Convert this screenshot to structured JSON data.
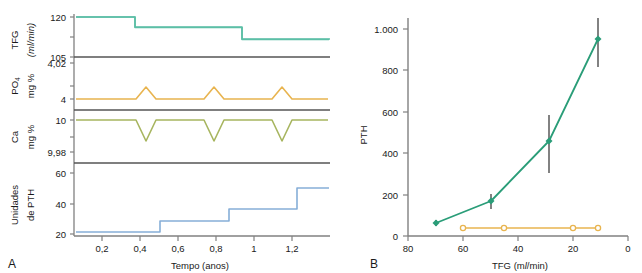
{
  "figure": {
    "panel_a_letter": "A",
    "panel_b_letter": "B"
  },
  "panel_a": {
    "x_axis": {
      "title": "Tempo (anos)",
      "ticks": [
        "0,2",
        "0,4",
        "0,6",
        "0,8",
        "1",
        "1,2"
      ],
      "tick_values": [
        0.2,
        0.4,
        0.6,
        0.8,
        1.0,
        1.2
      ],
      "range": [
        0.1,
        1.37
      ]
    },
    "tracks": [
      {
        "name": "tfg",
        "label_line1": "TFG",
        "label_line2": "(ml/min)",
        "y_ticks": [
          "120",
          "105"
        ],
        "y_tick_values": [
          120,
          105
        ],
        "color": "#5cbfa6"
      },
      {
        "name": "po4",
        "label_line1": "PO4",
        "label_line2": "mg %",
        "y_ticks": [
          "4,02",
          "4"
        ],
        "y_tick_values": [
          4.02,
          4
        ],
        "color": "#e8b44f"
      },
      {
        "name": "ca",
        "label_line1": "Ca",
        "label_line2": "mg %",
        "y_ticks": [
          "10",
          "9,98"
        ],
        "y_tick_values": [
          10,
          9.98
        ],
        "color": "#a7b55f"
      },
      {
        "name": "pth",
        "label_line1": "Unidades",
        "label_line2": "de PTH",
        "y_ticks": [
          "60",
          "40",
          "20"
        ],
        "y_tick_values": [
          60,
          40,
          20
        ],
        "color": "#86aed8"
      }
    ],
    "chart_data": [
      {
        "type": "line",
        "name": "tfg-step-series",
        "title": "TFG (ml/min) ao longo do tempo",
        "xlabel": "Tempo (anos)",
        "ylabel": "TFG (ml/min)",
        "xlim": [
          0.1,
          1.37
        ],
        "ylim": [
          105,
          122
        ],
        "grid": false,
        "step": "post",
        "x": [
          0.1,
          0.295,
          0.295,
          0.615,
          0.615,
          0.955,
          0.955,
          1.37
        ],
        "y": [
          120,
          120,
          117.2,
          117.2,
          113.9,
          113.9,
          110.6,
          110.6
        ]
      },
      {
        "type": "line",
        "name": "po4-series",
        "title": "PO4 mg % ao longo do tempo",
        "xlabel": "Tempo (anos)",
        "ylabel": "PO4 mg %",
        "xlim": [
          0.1,
          1.37
        ],
        "ylim": [
          3.99,
          4.025
        ],
        "grid": false,
        "x": [
          0.1,
          0.3,
          0.35,
          0.4,
          0.62,
          0.665,
          0.71,
          0.935,
          0.985,
          1.03,
          1.26,
          1.305,
          1.37
        ],
        "y": [
          3.997,
          3.997,
          4.012,
          3.997,
          3.997,
          4.012,
          3.997,
          3.997,
          4.012,
          3.997,
          3.997,
          4.012,
          4.005
        ]
      },
      {
        "type": "line",
        "name": "ca-series",
        "title": "Ca mg % ao longo do tempo",
        "xlabel": "Tempo (anos)",
        "ylabel": "Ca mg %",
        "xlim": [
          0.1,
          1.37
        ],
        "ylim": [
          9.975,
          10.004
        ],
        "grid": false,
        "x": [
          0.1,
          0.3,
          0.35,
          0.4,
          0.62,
          0.665,
          0.71,
          0.935,
          0.985,
          1.03,
          1.26,
          1.305,
          1.37
        ],
        "y": [
          10.0,
          10.0,
          9.9865,
          10.0,
          10.0,
          9.9865,
          10.0,
          10.0,
          9.9865,
          10.0,
          10.0,
          9.9865,
          9.992
        ]
      },
      {
        "type": "line",
        "name": "pth-step-series",
        "title": "Unidades de PTH ao longo do tempo",
        "xlabel": "Tempo (anos)",
        "ylabel": "Unidades de PTH",
        "xlim": [
          0.1,
          1.37
        ],
        "ylim": [
          18,
          64
        ],
        "grid": false,
        "step": "post",
        "x": [
          0.1,
          0.42,
          0.42,
          0.745,
          0.745,
          1.06,
          1.06,
          1.37
        ],
        "y": [
          21.5,
          21.5,
          28.5,
          28.5,
          36.5,
          36.5,
          50.5,
          50.5
        ]
      }
    ]
  },
  "panel_b": {
    "chart_data": {
      "type": "line",
      "title": "PTH versus TFG",
      "xlabel": "TFG (ml/min)",
      "ylabel": "PTH",
      "xlim": [
        80,
        0
      ],
      "ylim": [
        0,
        1060
      ],
      "x_ticks": [
        "80",
        "60",
        "40",
        "20",
        "0"
      ],
      "x_tick_values": [
        80,
        60,
        40,
        20,
        0
      ],
      "y_ticks": [
        "0",
        "200",
        "400",
        "600",
        "800",
        "1.000"
      ],
      "y_tick_values": [
        0,
        200,
        400,
        600,
        800,
        1000
      ],
      "x_axis_reversed": true,
      "grid": false,
      "legend": "none",
      "series": [
        {
          "name": "pth-elevado",
          "color": "#2a9d78",
          "marker": "filled-diamond",
          "x": [
            70,
            50,
            29,
            11
          ],
          "values": [
            65,
            168,
            460,
            960
          ],
          "error_low": [
            50,
            130,
            305,
            820
          ],
          "error_high": [
            80,
            205,
            585,
            1100
          ]
        },
        {
          "name": "pth-normal",
          "color": "#e8b44f",
          "marker": "open-circle",
          "x": [
            60,
            45,
            20,
            11
          ],
          "values": [
            40,
            40,
            40,
            40
          ]
        }
      ]
    }
  }
}
